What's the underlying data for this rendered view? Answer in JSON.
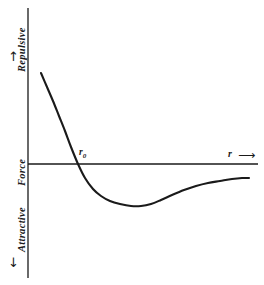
{
  "figure": {
    "background_color": "#ffffff",
    "ink_color": "#1a1a1a"
  },
  "labels": {
    "repulsive": "Repulsive",
    "force": "Force",
    "attractive": "Attractive",
    "r_axis": "r",
    "r_zero": "r",
    "r_zero_subscript": "0",
    "arrow_up": "↑",
    "arrow_down": "↓",
    "arrow_right": "⟶"
  },
  "chart_data": {
    "type": "line",
    "title": "",
    "xlabel": "r",
    "ylabel": "Force",
    "grid": false,
    "legend": null,
    "annotations": [
      {
        "text": "r0",
        "meaning": "equilibrium separation where net force is zero",
        "x_px": 78,
        "y_px": 164
      },
      {
        "text": "Repulsive",
        "meaning": "positive force direction, upward along vertical axis"
      },
      {
        "text": "Attractive",
        "meaning": "negative force direction, downward along vertical axis"
      },
      {
        "text": "Force",
        "meaning": "vertical axis quantity label at the zero line"
      },
      {
        "text": "r",
        "meaning": "horizontal axis: interatomic separation, increasing rightward"
      }
    ],
    "axes_px": {
      "vertical_axis_x": 28,
      "vertical_axis_y_top": 8,
      "vertical_axis_y_bottom": 278,
      "zero_line_y": 164,
      "zero_line_x_start": 28,
      "zero_line_x_end": 258
    },
    "series": [
      {
        "name": "net interatomic force",
        "points_px": [
          [
            41,
            73
          ],
          [
            47,
            87
          ],
          [
            53,
            101
          ],
          [
            59,
            116
          ],
          [
            65,
            131
          ],
          [
            71,
            147
          ],
          [
            78,
            164
          ],
          [
            85,
            178
          ],
          [
            93,
            189
          ],
          [
            101,
            196
          ],
          [
            110,
            201
          ],
          [
            120,
            204
          ],
          [
            131,
            206
          ],
          [
            141,
            206
          ],
          [
            151,
            204
          ],
          [
            161,
            200
          ],
          [
            172,
            195
          ],
          [
            184,
            190
          ],
          [
            196,
            186
          ],
          [
            208,
            183
          ],
          [
            220,
            181
          ],
          [
            232,
            179
          ],
          [
            242,
            178
          ],
          [
            249,
            178
          ]
        ]
      }
    ]
  }
}
